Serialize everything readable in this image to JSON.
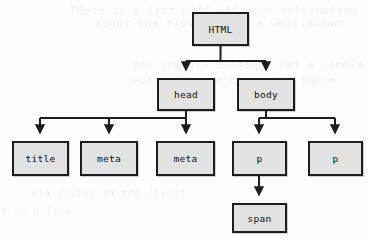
{
  "diagram": {
    "type": "dom-tree",
    "nodes": [
      {
        "id": "html",
        "label": "HTML",
        "x": 192,
        "y": 12,
        "w": 57,
        "h": 34
      },
      {
        "id": "head",
        "label": "head",
        "x": 157,
        "y": 78,
        "w": 58,
        "h": 33
      },
      {
        "id": "body",
        "label": "body",
        "x": 237,
        "y": 78,
        "w": 58,
        "h": 33
      },
      {
        "id": "title",
        "label": "title",
        "x": 12,
        "y": 141,
        "w": 57,
        "h": 35
      },
      {
        "id": "meta1",
        "label": "meta",
        "x": 80,
        "y": 141,
        "w": 58,
        "h": 35
      },
      {
        "id": "meta2",
        "label": "meta",
        "x": 156,
        "y": 141,
        "w": 59,
        "h": 35
      },
      {
        "id": "p1",
        "label": "p",
        "x": 232,
        "y": 141,
        "w": 55,
        "h": 35
      },
      {
        "id": "p2",
        "label": "p",
        "x": 308,
        "y": 141,
        "w": 55,
        "h": 35
      },
      {
        "id": "span",
        "label": "span",
        "x": 232,
        "y": 203,
        "w": 55,
        "h": 30
      }
    ],
    "edges": [
      {
        "from": "html",
        "to": "head"
      },
      {
        "from": "html",
        "to": "body"
      },
      {
        "from": "head",
        "to": "title"
      },
      {
        "from": "head",
        "to": "meta1"
      },
      {
        "from": "head",
        "to": "meta2"
      },
      {
        "from": "body",
        "to": "p1"
      },
      {
        "from": "body",
        "to": "p2"
      },
      {
        "from": "p1",
        "to": "span"
      }
    ],
    "colors": {
      "node_fill": "#e2e2e2",
      "node_border": "#1d1d1d",
      "edge": "#1d1d1d",
      "background": "#fdfdfd",
      "text": "#111111"
    }
  },
  "background_artifact": {
    "description": "faint illegible show-through text from the reverse of the scanned page",
    "lines": [
      {
        "text": "noitamrofni ruoy lla htiw tsil a si erehT",
        "x": 14,
        "y": 4,
        "size": 11
      },
      {
        "text": "nwonk-llew a sdaol rewolf eht tuoba",
        "x": 30,
        "y": 17,
        "size": 11
      },
      {
        "text": "elpmis a rof stnemele esu nac uoy",
        "x": 8,
        "y": 58,
        "size": 11
      },
      {
        "text": "ecaps eht ni sdrow wef a hcus",
        "x": 36,
        "y": 74,
        "size": 11
      },
      {
        "text": "tuoyal eht ni detsil era",
        "x": 186,
        "y": 188,
        "size": 10
      },
      {
        "text": "enil a ot txen",
        "x": 300,
        "y": 206,
        "size": 10
      }
    ]
  }
}
